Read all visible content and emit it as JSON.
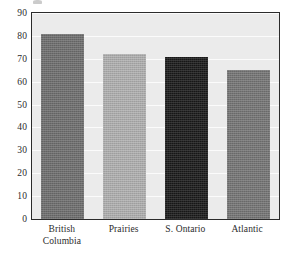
{
  "chart_data": {
    "type": "bar",
    "title": "",
    "subtitle": "",
    "xlabel": "",
    "ylabel": "",
    "categories": [
      "British\nColumbia",
      "Prairies",
      "S. Ontario",
      "Atlantic"
    ],
    "category_labels_flat": [
      "British Columbia",
      "Prairies",
      "S. Ontario",
      "Atlantic"
    ],
    "values": [
      81,
      72,
      71,
      65
    ],
    "ylim": [
      0,
      90
    ],
    "ytick_labels": [
      "90",
      "80",
      "70",
      "60",
      "50",
      "40",
      "30",
      "20",
      "10",
      "0"
    ],
    "ytick_values": [
      90,
      80,
      70,
      60,
      50,
      40,
      30,
      20,
      10,
      0
    ],
    "grid": true,
    "grid_axis": "y",
    "legend": false,
    "legend_position": "none",
    "annotations": [],
    "bar_colors": [
      "#6e6e6e",
      "#b0b0b0",
      "#1a1a1a",
      "#757575"
    ],
    "plot_background": "#ebebeb",
    "gridline_color": "#fbfbfb",
    "axis_color": "#2b2b2b",
    "page_background": "#ffffff"
  }
}
